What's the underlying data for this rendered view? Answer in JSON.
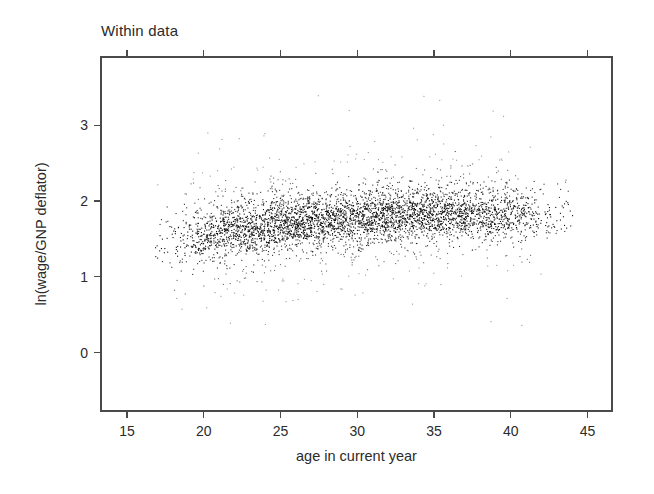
{
  "figure": {
    "title": "Within data",
    "background_color": "#ffffff",
    "frame_color": "#4a4a4a",
    "point_color": "#111111"
  },
  "chart_data": {
    "type": "scatter",
    "title": "Within data",
    "xlabel": "age in current year",
    "ylabel": "ln(wage/GNP deflator)",
    "xlim": [
      13.3,
      46.6
    ],
    "ylim": [
      -0.77,
      3.9
    ],
    "xticks": [
      15,
      20,
      25,
      30,
      35,
      40,
      45
    ],
    "xticklabels": [
      "15",
      "20",
      "25",
      "30",
      "35",
      "40",
      "45"
    ],
    "yticks": [
      0,
      1,
      2,
      3
    ],
    "yticklabels": [
      "0",
      "1",
      "2",
      "3"
    ],
    "grid": false,
    "legend": null,
    "marker": "point",
    "marker_size_px": 1.1,
    "n_points": 4360,
    "distribution": {
      "x_range_visible": [
        16.8,
        44.0
      ],
      "x_dense_range": [
        19.5,
        41.0
      ],
      "y_core_range": [
        1.35,
        2.05
      ],
      "y_outlier_range": [
        -0.45,
        3.55
      ],
      "trend_points": [
        {
          "age": 18,
          "mean_ln_wage": 1.47,
          "sd": 0.3,
          "weight": 0.1
        },
        {
          "age": 20,
          "mean_ln_wage": 1.55,
          "sd": 0.31,
          "weight": 0.55
        },
        {
          "age": 22,
          "mean_ln_wage": 1.62,
          "sd": 0.31,
          "weight": 0.9
        },
        {
          "age": 25,
          "mean_ln_wage": 1.7,
          "sd": 0.3,
          "weight": 1.0
        },
        {
          "age": 28,
          "mean_ln_wage": 1.76,
          "sd": 0.29,
          "weight": 1.0
        },
        {
          "age": 31,
          "mean_ln_wage": 1.8,
          "sd": 0.29,
          "weight": 0.98
        },
        {
          "age": 34,
          "mean_ln_wage": 1.83,
          "sd": 0.28,
          "weight": 0.92
        },
        {
          "age": 37,
          "mean_ln_wage": 1.84,
          "sd": 0.28,
          "weight": 0.8
        },
        {
          "age": 40,
          "mean_ln_wage": 1.84,
          "sd": 0.28,
          "weight": 0.55
        },
        {
          "age": 42,
          "mean_ln_wage": 1.83,
          "sd": 0.27,
          "weight": 0.18
        },
        {
          "age": 44,
          "mean_ln_wage": 1.82,
          "sd": 0.26,
          "weight": 0.04
        }
      ]
    }
  },
  "geometry": {
    "plot_left_px": 101,
    "plot_right_px": 612,
    "plot_top_px": 57,
    "plot_bottom_px": 411,
    "x_axis_value_at_left": 13.3,
    "x_axis_value_at_right": 46.6,
    "y_axis_value_at_bottom": -0.77,
    "y_axis_value_at_top": 3.9
  }
}
